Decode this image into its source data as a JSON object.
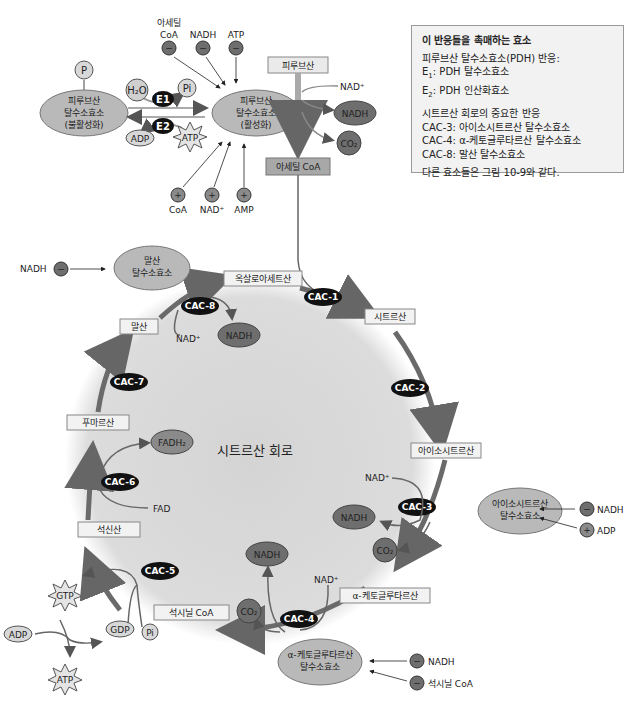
{
  "legend": {
    "title": "이 반응들을 촉매하는 효소",
    "pdh_heading": "피루브산 탈수소효소(PDH) 반응:",
    "e1": {
      "label": "E",
      "sub": "1",
      "text": ":  PDH 탈수소효소"
    },
    "e2": {
      "label": "E",
      "sub": "2",
      "text": ":  PDH 인산화효소"
    },
    "cac_heading": "시트르산 회로의 중요한 반응",
    "cac3": "CAC-3:  아이소시트르산 탈수소효소",
    "cac4": "CAC-4:  α-케토글루타르산 탈수소효소",
    "cac8": "CAC-8:  말산 탈수소효소",
    "footer": "다른 효소들은 그림 10-9와 같다."
  },
  "pdh_regulation": {
    "inactive": {
      "line1": "피루브산",
      "line2": "탈수소효소",
      "line3": "(불활성화)"
    },
    "active": {
      "line1": "피루브산",
      "line2": "탈수소효소",
      "line3": "(활성화)"
    },
    "phosphate": "P",
    "h2o": "H₂O",
    "pi": "Pi",
    "e1": "E1",
    "e2": "E2",
    "adp": "ADP",
    "atp": "ATP",
    "inhibitors": [
      {
        "line1": "아세틸",
        "line2": "CoA",
        "sign": "−"
      },
      {
        "line1": "",
        "line2": "NADH",
        "sign": "−"
      },
      {
        "line1": "",
        "line2": "ATP",
        "sign": "−"
      }
    ],
    "activators": [
      {
        "label": "CoA",
        "sign": "+"
      },
      {
        "label": "NAD⁺",
        "sign": "+"
      },
      {
        "label": "AMP",
        "sign": "+"
      }
    ]
  },
  "pdh_reaction": {
    "substrate": "피루브산",
    "product": "아세틸 CoA",
    "nad": "NAD⁺",
    "nadh": "NADH",
    "co2": "CO₂"
  },
  "cycle": {
    "title": "시트르산 회로",
    "intermediates": {
      "oxaloacetate": "옥살로아세트산",
      "citrate": "시트르산",
      "isocitrate": "아이소시트르산",
      "akg": "α-케토글루타르산",
      "succinyl_coa": "석시닐 CoA",
      "succinate": "석신산",
      "fumarate": "푸마르산",
      "malate": "말산"
    },
    "steps": {
      "cac1": "CAC-1",
      "cac2": "CAC-2",
      "cac3": "CAC-3",
      "cac4": "CAC-4",
      "cac5": "CAC-5",
      "cac6": "CAC-6",
      "cac7": "CAC-7",
      "cac8": "CAC-8"
    },
    "cofactors": {
      "nad_plus": "NAD⁺",
      "nadh": "NADH",
      "co2": "CO₂",
      "fad": "FAD",
      "fadh2": "FADH₂",
      "gtp": "GTP",
      "gdp": "GDP",
      "pi": "Pi",
      "adp": "ADP",
      "atp": "ATP"
    }
  },
  "regulators": {
    "malate_dh": {
      "line1": "말산",
      "line2": "탈수소효소",
      "inhibitor": "NADH",
      "sign": "−"
    },
    "isocitrate_dh": {
      "line1": "아이소시트르산",
      "line2": "탈수소효소",
      "inhibitor": "NADH",
      "activator": "ADP",
      "minus": "−",
      "plus": "+"
    },
    "akg_dh": {
      "line1": "α-케토글루타르산",
      "line2": "탈수소효소",
      "inhibitor1": "NADH",
      "inhibitor2": "석시닐 CoA",
      "sign": "−"
    }
  },
  "colors": {
    "enzyme_fill": "#b9b9b9",
    "dark_circle": "#6e6e6e",
    "arrow": "#6a6a6a",
    "cycle_bg": "#d9d9d9",
    "black_badge": "#111111"
  }
}
